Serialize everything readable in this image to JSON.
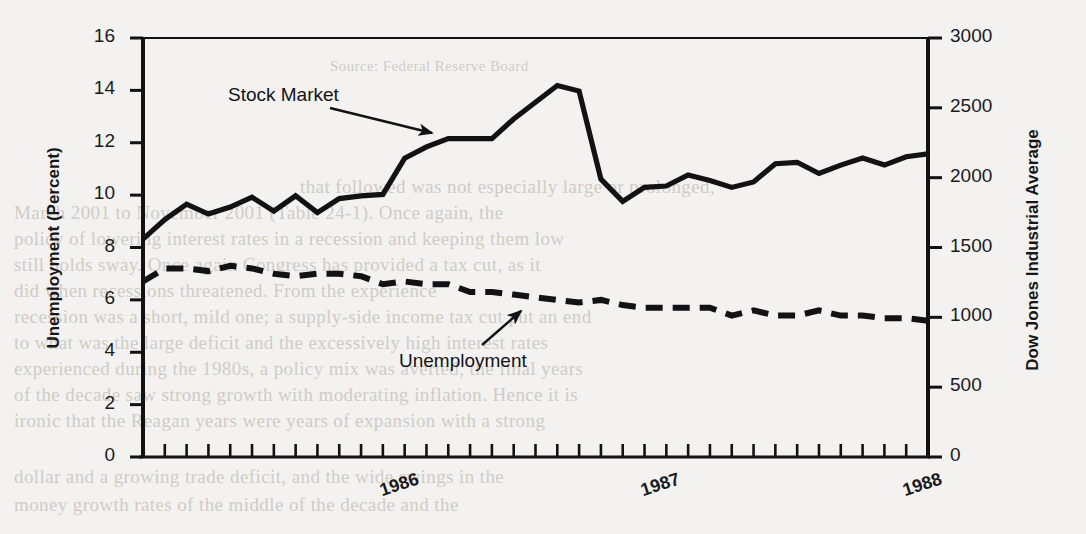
{
  "figure": {
    "background_color": "#f3f2f0",
    "ink_color": "#121214"
  },
  "axes": {
    "left": {
      "title": "Unemployment (Percent)",
      "ticks": [
        0,
        2,
        4,
        6,
        8,
        10,
        12,
        14,
        16
      ],
      "min": 0,
      "max": 16
    },
    "right": {
      "title": "Dow Jones Industrial Average",
      "ticks": [
        0,
        500,
        1000,
        1500,
        2000,
        2500,
        3000
      ],
      "min": 0,
      "max": 3000
    },
    "x": {
      "tick_labels": [
        "1986",
        "1987",
        "1988"
      ],
      "tick_label_positions": [
        12,
        24,
        36
      ],
      "minor_tick_count": 37
    }
  },
  "annotations": [
    {
      "text": "Stock Market",
      "x": 228,
      "y": 84,
      "arrow_to_x": 432,
      "arrow_to_y": 133,
      "arrow_from_x": 330,
      "arrow_from_y": 108
    },
    {
      "text": "Unemployment",
      "x": 399,
      "y": 350,
      "arrow_to_x": 521,
      "arrow_to_y": 311,
      "arrow_from_x": 482,
      "arrow_from_y": 345
    }
  ],
  "ghost_text": [
    {
      "text": "Source: Federal Reserve Board",
      "x": 330,
      "y": 58,
      "size": 15
    },
    {
      "text": "that followed was not especially large or prolonged,",
      "x": 300,
      "y": 176,
      "size": 19
    },
    {
      "text": "March 2001 to November 2001 (Table 24-1). Once again, the",
      "x": 14,
      "y": 202,
      "size": 19
    },
    {
      "text": "policy of lowering interest rates in a recession and keeping them low",
      "x": 14,
      "y": 228,
      "size": 19
    },
    {
      "text": "still holds sway. Once again Congress has provided a tax cut, as it",
      "x": 14,
      "y": 254,
      "size": 19
    },
    {
      "text": "did when recessions threatened. From the experience",
      "x": 14,
      "y": 280,
      "size": 19
    },
    {
      "text": "recession was a short, mild one; a supply-side income tax cut put an end",
      "x": 14,
      "y": 306,
      "size": 19
    },
    {
      "text": "to what was the large deficit and the excessively high interest rates",
      "x": 14,
      "y": 332,
      "size": 19
    },
    {
      "text": "experienced during the 1980s, a policy mix was averted, the final years",
      "x": 14,
      "y": 358,
      "size": 19
    },
    {
      "text": "of the decade saw strong growth with moderating inflation. Hence it is",
      "x": 14,
      "y": 384,
      "size": 19
    },
    {
      "text": "ironic that the Reagan years were years of expansion with a strong",
      "x": 14,
      "y": 410,
      "size": 19
    },
    {
      "text": "dollar and a growing trade deficit, and the wide swings in the",
      "x": 14,
      "y": 466,
      "size": 19
    },
    {
      "text": "money growth rates of the middle of the decade and the",
      "x": 14,
      "y": 494,
      "size": 19
    }
  ],
  "chart_data": {
    "type": "line",
    "title": "",
    "xlabel": "",
    "ylabel": "Unemployment (Percent)",
    "y2label": "Dow Jones Industrial Average",
    "ylim": [
      0,
      16
    ],
    "y2lim": [
      0,
      3000
    ],
    "grid": false,
    "legend_position": "inline-annotation",
    "x": [
      "1986-01",
      "1986-02",
      "1986-03",
      "1986-04",
      "1986-05",
      "1986-06",
      "1986-07",
      "1986-08",
      "1986-09",
      "1986-10",
      "1986-11",
      "1986-12",
      "1987-01",
      "1987-02",
      "1987-03",
      "1987-04",
      "1987-05",
      "1987-06",
      "1987-07",
      "1987-08",
      "1987-09",
      "1987-10",
      "1987-11",
      "1987-12",
      "1988-01",
      "1988-02",
      "1988-03",
      "1988-04",
      "1988-05",
      "1988-06",
      "1988-07",
      "1988-08",
      "1988-09",
      "1988-10",
      "1988-11",
      "1988-12",
      "1989-01"
    ],
    "series": [
      {
        "name": "Stock Market",
        "axis": "right",
        "style": "solid",
        "unit": "Dow Jones Industrial Average (index level)",
        "values_right_axis": [
          1560,
          1700,
          1810,
          1740,
          1790,
          1860,
          1760,
          1870,
          1750,
          1850,
          1870,
          1880,
          2140,
          2220,
          2280,
          2280,
          2280,
          2420,
          2540,
          2660,
          2620,
          1990,
          1830,
          1930,
          1940,
          2020,
          1980,
          1930,
          1970,
          2100,
          2110,
          2030,
          2090,
          2140,
          2090,
          2150,
          2170
        ],
        "values_as_plotted_percent_scale": [
          8.3,
          9.1,
          9.65,
          9.3,
          9.55,
          9.95,
          9.4,
          10.0,
          9.35,
          9.85,
          10.0,
          10.05,
          11.4,
          11.85,
          12.15,
          12.15,
          12.15,
          12.9,
          13.55,
          14.05,
          13.9,
          10.6,
          9.75,
          10.3,
          10.35,
          10.75,
          10.55,
          10.3,
          10.5,
          11.2,
          11.25,
          10.8,
          11.15,
          11.4,
          11.15,
          11.45,
          11.55
        ]
      },
      {
        "name": "Unemployment",
        "axis": "left",
        "style": "dashed",
        "unit": "percent",
        "values": [
          6.7,
          7.2,
          7.2,
          7.1,
          7.3,
          7.2,
          7.0,
          6.9,
          7.0,
          7.0,
          6.9,
          6.6,
          6.7,
          6.6,
          6.6,
          6.3,
          6.3,
          6.2,
          6.1,
          6.0,
          5.9,
          6.0,
          5.8,
          5.7,
          5.7,
          5.7,
          5.7,
          5.4,
          5.6,
          5.4,
          5.4,
          5.6,
          5.4,
          5.4,
          5.3,
          5.3,
          5.2
        ]
      }
    ]
  }
}
